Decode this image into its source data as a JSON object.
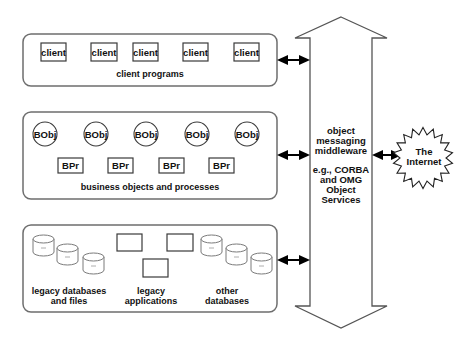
{
  "diagram": {
    "panels": [
      {
        "id": "client-programs",
        "label": "client programs",
        "items": [
          "client",
          "client",
          "client",
          "client",
          "client"
        ]
      },
      {
        "id": "business-objects",
        "label": "business objects and processes",
        "objects": [
          "BObj",
          "BObj",
          "BObj",
          "BObj",
          "BObj"
        ],
        "processes": [
          "BPr",
          "BPr",
          "BPr",
          "BPr"
        ]
      },
      {
        "id": "legacy",
        "groups": [
          {
            "label_line1": "legacy databases",
            "label_line2": "and files"
          },
          {
            "label_line1": "legacy",
            "label_line2": "applications"
          },
          {
            "label_line1": "other",
            "label_line2": "databases"
          }
        ]
      }
    ],
    "middleware": {
      "lines": [
        "object",
        "messaging",
        "middleware",
        "",
        "e.g., CORBA",
        "and OMG",
        "Object",
        "Services"
      ]
    },
    "internet": {
      "line1": "The",
      "line2": "Internet"
    },
    "colors": {
      "panel_stroke": "#6e6e6e",
      "connector": "#000000",
      "background": "#ffffff"
    }
  }
}
